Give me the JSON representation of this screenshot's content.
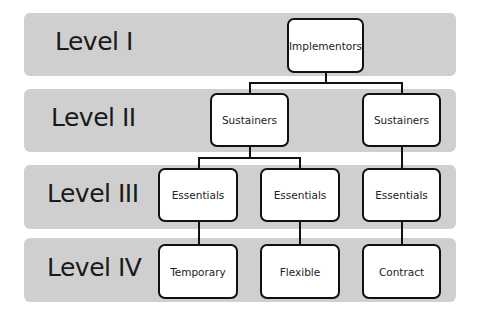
{
  "levels": [
    {
      "label": "Level I"
    },
    {
      "label": "Level II"
    },
    {
      "label": "Level III"
    },
    {
      "label": "Level IV"
    }
  ],
  "nodes": {
    "implementors": "Implementors",
    "sustainers_left": "Sustainers",
    "sustainers_right": "Sustainers",
    "essentials_left": "Essentials",
    "essentials_mid": "Essentials",
    "essentials_right": "Essentials",
    "temporary": "Temporary",
    "flexible": "Flexible",
    "contract": "Contract"
  },
  "colors": {
    "band": "#cfcfcf",
    "node_border": "#111111",
    "node_fill": "#ffffff"
  }
}
